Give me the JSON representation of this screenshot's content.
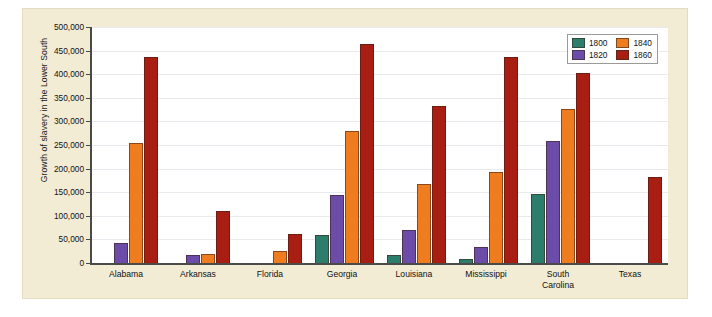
{
  "figure": {
    "panel_background": "#f3ecd5",
    "plot_background": "#ffffff",
    "axis_color": "#4a4a48",
    "gridline_color": "#e9e9ef"
  },
  "legend": {
    "position": "top-right",
    "entries": [
      {
        "label": "1800",
        "color": "#2d7d6d",
        "swatch_name": "legend-swatch-1800"
      },
      {
        "label": "1840",
        "color": "#f07c20",
        "swatch_name": "legend-swatch-1840"
      },
      {
        "label": "1820",
        "color": "#6b4ca8",
        "swatch_name": "legend-swatch-1820"
      },
      {
        "label": "1860",
        "color": "#a81e12",
        "swatch_name": "legend-swatch-1860"
      }
    ]
  },
  "chart_data": {
    "type": "bar",
    "title": "",
    "subtitle": "",
    "xlabel": "",
    "ylabel": "Growth of slavery in the Lower South",
    "ylim": [
      0,
      500000
    ],
    "ytick_step": 50000,
    "ytick_labels": [
      "0",
      "50,000",
      "100,000",
      "150,000",
      "200,000",
      "250,000",
      "300,000",
      "350,000",
      "400,000",
      "450,000",
      "500,000"
    ],
    "ytick_values": [
      0,
      50000,
      100000,
      150000,
      200000,
      250000,
      300000,
      350000,
      400000,
      450000,
      500000
    ],
    "grid": true,
    "categories": [
      "Alabama",
      "Arkansas",
      "Florida",
      "Georgia",
      "Louisiana",
      "Mississippi",
      "South Carolina",
      "Texas"
    ],
    "category_labels": [
      [
        "Alabama"
      ],
      [
        "Arkansas"
      ],
      [
        "Florida"
      ],
      [
        "Georgia"
      ],
      [
        "Louisiana"
      ],
      [
        "Mississippi"
      ],
      [
        "South",
        "Carolina"
      ],
      [
        "Texas"
      ]
    ],
    "series": [
      {
        "name": "1800",
        "color": "#2d7d6d",
        "values": [
          0,
          0,
          0,
          59000,
          16000,
          8000,
          146000,
          0
        ]
      },
      {
        "name": "1820",
        "color": "#6b4ca8",
        "values": [
          42000,
          17000,
          0,
          145000,
          70000,
          33000,
          258000,
          0
        ]
      },
      {
        "name": "1840",
        "color": "#f07c20",
        "values": [
          255000,
          20000,
          26000,
          280000,
          167000,
          192000,
          327000,
          0
        ]
      },
      {
        "name": "1860",
        "color": "#a81e12",
        "values": [
          437000,
          111000,
          62000,
          465000,
          332000,
          436000,
          402000,
          182000
        ]
      }
    ]
  }
}
